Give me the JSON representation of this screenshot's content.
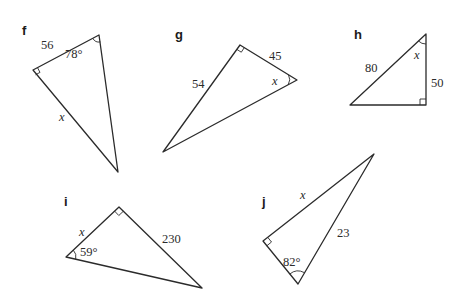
{
  "triangles": {
    "f": {
      "label": "f",
      "side_known": "56",
      "angle_known": "78°",
      "unknown": "x",
      "right_angle": true
    },
    "g": {
      "label": "g",
      "side_a": "45",
      "side_b": "54",
      "unknown": "x",
      "right_angle": true
    },
    "h": {
      "label": "h",
      "hypotenuse": "80",
      "side": "50",
      "unknown": "x",
      "right_angle": true
    },
    "i": {
      "label": "i",
      "side_known": "230",
      "angle_known": "59°",
      "unknown": "x",
      "right_angle": true
    },
    "j": {
      "label": "j",
      "side_known": "23",
      "angle_known": "82°",
      "unknown": "x",
      "right_angle": true
    }
  }
}
